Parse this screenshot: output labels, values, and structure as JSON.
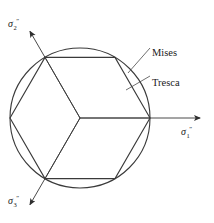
{
  "figure": {
    "type": "yield-criteria-pi-plane",
    "background": "#ffffff",
    "stroke_color": "#3a3a3a",
    "text_color": "#1a1a1a",
    "width": 214,
    "height": 223
  },
  "geometry": {
    "center": {
      "x": 80,
      "y": 118
    },
    "circle_radius": 70,
    "hexagon_vertex_angles_deg": [
      0,
      60,
      120,
      180,
      240,
      300
    ],
    "hexagon_vertices": [
      {
        "x": 150,
        "y": 118,
        "angle_deg": 0
      },
      {
        "x": 115,
        "y": 57.4,
        "angle_deg": 60
      },
      {
        "x": 45,
        "y": 57.4,
        "angle_deg": 120
      },
      {
        "x": 10,
        "y": 118,
        "angle_deg": 180
      },
      {
        "x": 45,
        "y": 178.6,
        "angle_deg": 240
      },
      {
        "x": 115,
        "y": 178.6,
        "angle_deg": 300
      }
    ],
    "interior_radii_angles_deg": [
      0,
      120,
      240
    ]
  },
  "axes": [
    {
      "id": "sigma1",
      "symbol": "σ",
      "subscript": "1",
      "superscript": "″",
      "angle_deg": 0,
      "length": 120,
      "label_x": 181,
      "label_y": 127,
      "arrow": true
    },
    {
      "id": "sigma2",
      "symbol": "σ",
      "subscript": "2",
      "superscript": "″",
      "angle_deg": 120,
      "length": 100,
      "label_x": 8,
      "label_y": 19,
      "arrow": true
    },
    {
      "id": "sigma3",
      "symbol": "σ",
      "subscript": "3",
      "superscript": "″",
      "angle_deg": 240,
      "length": 100,
      "label_x": 8,
      "label_y": 196,
      "arrow": true
    }
  ],
  "annotations": [
    {
      "id": "mises",
      "label": "Mises",
      "label_x": 152,
      "label_y": 48,
      "leader": {
        "x1": 150,
        "y1": 48,
        "x2": 128,
        "y2": 73
      },
      "target": "circle"
    },
    {
      "id": "tresca",
      "label": "Tresca",
      "label_x": 152,
      "label_y": 78,
      "leader": {
        "x1": 150,
        "y1": 76,
        "x2": 126,
        "y2": 90
      },
      "target": "hexagon"
    }
  ]
}
